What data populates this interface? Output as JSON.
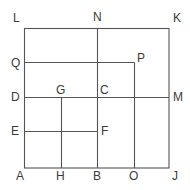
{
  "diagram": {
    "type": "geometry-figure",
    "colors": {
      "line": "#555555",
      "label": "#3a3a3a",
      "background": "#ffffff"
    },
    "points": {
      "A": {
        "label": "A",
        "x": 24,
        "y": 168
      },
      "B": {
        "label": "B",
        "x": 97,
        "y": 168
      },
      "C": {
        "label": "C",
        "x": 97,
        "y": 97
      },
      "D": {
        "label": "D",
        "x": 24,
        "y": 97
      },
      "E": {
        "label": "E",
        "x": 24,
        "y": 131
      },
      "F": {
        "label": "F",
        "x": 97,
        "y": 131
      },
      "G": {
        "label": "G",
        "x": 61,
        "y": 97
      },
      "H": {
        "label": "H",
        "x": 61,
        "y": 168
      },
      "J": {
        "label": "J",
        "x": 169,
        "y": 168
      },
      "K": {
        "label": "K",
        "x": 169,
        "y": 28
      },
      "L": {
        "label": "L",
        "x": 24,
        "y": 28
      },
      "M": {
        "label": "M",
        "x": 169,
        "y": 97
      },
      "N": {
        "label": "N",
        "x": 97,
        "y": 28
      },
      "O": {
        "label": "O",
        "x": 134,
        "y": 168
      },
      "P": {
        "label": "P",
        "x": 134,
        "y": 62
      },
      "Q": {
        "label": "Q",
        "x": 24,
        "y": 62
      }
    },
    "segments": [
      [
        "L",
        "K"
      ],
      [
        "K",
        "J"
      ],
      [
        "J",
        "A"
      ],
      [
        "A",
        "L"
      ],
      [
        "N",
        "B"
      ],
      [
        "D",
        "M"
      ],
      [
        "Q",
        "P"
      ],
      [
        "P",
        "O"
      ],
      [
        "G",
        "H"
      ],
      [
        "E",
        "F"
      ]
    ]
  }
}
